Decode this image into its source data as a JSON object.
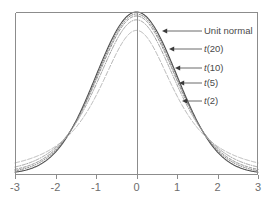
{
  "chart_data": {
    "type": "line",
    "title": "",
    "subtitle": "",
    "xlabel": "",
    "ylabel": "",
    "xlim": [
      -3,
      3
    ],
    "ylim": [
      0,
      0.3989
    ],
    "grid": false,
    "legend_position": "inline-annotations",
    "x_ticks": [
      "-3",
      "-2",
      "-1",
      "0",
      "1",
      "2",
      "3"
    ],
    "x_tick_values": [
      -3,
      -2,
      -1,
      0,
      1,
      2,
      3
    ],
    "y_ticks": [],
    "center_line_x": 0,
    "series": [
      {
        "name": "Unit normal",
        "label": "Unit normal",
        "distribution": "normal",
        "df": null,
        "style": "solid",
        "color": "#4d4d4d",
        "width": 1.1,
        "peak_value": 0.3989,
        "anchor_x": 0.62
      },
      {
        "name": "t(20)",
        "label": "t(20)",
        "label_prefix": "t",
        "label_suffix": "(20)",
        "distribution": "t",
        "df": 20,
        "style": "dotted",
        "color": "#6e6e6e",
        "width": 1.0,
        "peak_value": 0.394,
        "anchor_x": 0.78
      },
      {
        "name": "t(10)",
        "label": "t(10)",
        "label_prefix": "t",
        "label_suffix": "(10)",
        "distribution": "t",
        "df": 10,
        "style": "dashed",
        "color": "#858585",
        "width": 1.0,
        "peak_value": 0.3891,
        "anchor_x": 0.98
      },
      {
        "name": "t(5)",
        "label": "t(5)",
        "label_prefix": "t",
        "label_suffix": "(5)",
        "distribution": "t",
        "df": 5,
        "style": "dashdot",
        "color": "#9c9c9c",
        "width": 1.0,
        "peak_value": 0.3796,
        "anchor_x": 1.12
      },
      {
        "name": "t(2)",
        "label": "t(2)",
        "label_prefix": "t",
        "label_suffix": "(2)",
        "distribution": "t",
        "df": 2,
        "style": "longdash",
        "color": "#b5b5b5",
        "width": 1.0,
        "peak_value": 0.3536,
        "anchor_x": 1.26
      }
    ],
    "annotations": [
      {
        "text": "Unit normal",
        "target_series": "Unit normal",
        "label_x_px": 204,
        "label_y_px": 26,
        "arrow_tip_px": [
          162,
          31
        ],
        "leader_end_px": 202
      },
      {
        "text": "t(20)",
        "target_series": "t(20)",
        "label_x_px": 204,
        "label_y_px": 44,
        "arrow_tip_px": [
          169,
          49
        ],
        "leader_end_px": 202
      },
      {
        "text": "t(10)",
        "target_series": "t(10)",
        "label_x_px": 204,
        "label_y_px": 63,
        "arrow_tip_px": [
          175,
          68
        ],
        "leader_end_px": 202
      },
      {
        "text": "t(5)",
        "target_series": "t(5)",
        "label_x_px": 204,
        "label_y_px": 78,
        "arrow_tip_px": [
          179,
          83
        ],
        "leader_end_px": 202
      },
      {
        "text": "t(2)",
        "target_series": "t(2)",
        "label_x_px": 204,
        "label_y_px": 96,
        "arrow_tip_px": [
          182,
          101
        ],
        "leader_end_px": 202
      }
    ]
  },
  "axes": {
    "frame_color": "#8c8c8c",
    "center_line_color": "#8c8c8c",
    "tick_color": "#8c8c8c",
    "tick_label_color": "#6d6d6d",
    "background": "#ffffff"
  },
  "plot_box_px": {
    "left": 15,
    "top": 12,
    "right": 258,
    "bottom": 174
  }
}
